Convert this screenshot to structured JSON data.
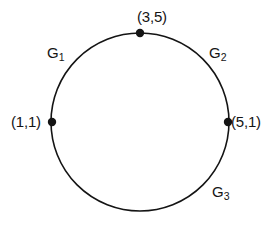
{
  "figure": {
    "type": "circle-diagram",
    "background_color": "#ffffff",
    "stroke_color": "#141414",
    "text_color": "#141414",
    "circle": {
      "center_x": 140,
      "center_y": 122,
      "radius": 89,
      "stroke_width": 1.6
    }
  },
  "vertices": [
    {
      "id": "top",
      "label": "(3,5)",
      "x": 140,
      "y": 33,
      "dot_radius": 4.2
    },
    {
      "id": "left",
      "label": "(1,1)",
      "x": 52,
      "y": 122,
      "dot_radius": 4.2
    },
    {
      "id": "right",
      "label": "(5,1)",
      "x": 228,
      "y": 122,
      "dot_radius": 4.2
    }
  ],
  "arcs": [
    {
      "id": "g1",
      "name": "G",
      "subscript": "1",
      "between": [
        "left",
        "top"
      ],
      "x": 47,
      "y": 45
    },
    {
      "id": "g2",
      "name": "G",
      "subscript": "2",
      "between": [
        "top",
        "right"
      ],
      "x": 209,
      "y": 45
    },
    {
      "id": "g3",
      "name": "G",
      "subscript": "3",
      "between": [
        "right",
        "left"
      ],
      "x": 212,
      "y": 184
    }
  ]
}
